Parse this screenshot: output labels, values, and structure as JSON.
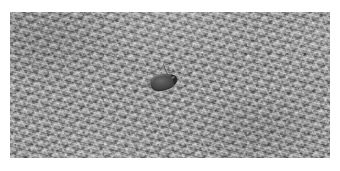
{
  "image": {
    "kind": "photograph",
    "subject_caption": "Dark crescent-shaped insect on fibrous gray surface",
    "color_mode": "grayscale",
    "width_px": 340,
    "height_px": 171
  },
  "frame": {
    "mat_color": "#ffffff",
    "mat_left_px": 10,
    "mat_top_px": 12,
    "photo_width_px": 320,
    "photo_height_px": 146
  },
  "background": {
    "name": "fibrous-straw-texture",
    "base_color": "#9c9c9c",
    "highlight_color": "#d6d6d6",
    "shadow_color": "#5e5e5e"
  },
  "subject": {
    "name": "dark-crescent-object",
    "center_x_px": 162,
    "center_y_px": 77,
    "length_px": 32,
    "body_color": "#4a4a4a",
    "body_dark_color": "#2e2e2e",
    "body_highlight_color": "#8a8a8a",
    "shadow_color": "#6e6e6e",
    "antenna_color": "#3a3a3a"
  }
}
